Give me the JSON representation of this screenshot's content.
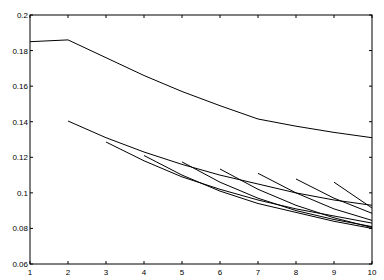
{
  "chart_data": {
    "type": "line",
    "title": "",
    "xlabel": "",
    "ylabel": "",
    "xlim": [
      1,
      10
    ],
    "ylim": [
      0.06,
      0.2
    ],
    "grid": false,
    "legend": "none",
    "x_ticks": [
      1,
      2,
      3,
      4,
      5,
      6,
      7,
      8,
      9,
      10
    ],
    "x_tick_labels": [
      "1",
      "2",
      "3",
      "4",
      "5",
      "6",
      "7",
      "8",
      "9",
      "10"
    ],
    "y_ticks": [
      0.06,
      0.08,
      0.1,
      0.12,
      0.14,
      0.16,
      0.18,
      0.2
    ],
    "y_tick_labels": [
      "0.06",
      "0.08",
      "0.1",
      "0.12",
      "0.14",
      "0.16",
      "0.18",
      "0.2"
    ],
    "series": [
      {
        "name": "series-1",
        "x": [
          1,
          2,
          3,
          4,
          5,
          6,
          7,
          8,
          9,
          10
        ],
        "values": [
          0.185,
          0.186,
          0.176,
          0.166,
          0.157,
          0.149,
          0.1415,
          0.1375,
          0.134,
          0.131
        ]
      },
      {
        "name": "series-2",
        "x": [
          2,
          3,
          4,
          5,
          6,
          7,
          8,
          9,
          10
        ],
        "values": [
          0.1404,
          0.131,
          0.123,
          0.116,
          0.11,
          0.105,
          0.1,
          0.096,
          0.093
        ]
      },
      {
        "name": "series-3",
        "x": [
          3,
          4,
          5,
          6,
          7,
          8,
          9,
          10
        ],
        "values": [
          0.1286,
          0.118,
          0.109,
          0.102,
          0.096,
          0.091,
          0.087,
          0.083
        ]
      },
      {
        "name": "series-4",
        "x": [
          4,
          5,
          6,
          7,
          8,
          9,
          10
        ],
        "values": [
          0.121,
          0.11,
          0.101,
          0.094,
          0.089,
          0.084,
          0.08
        ]
      },
      {
        "name": "series-5",
        "x": [
          5,
          6,
          7,
          8,
          9,
          10
        ],
        "values": [
          0.1174,
          0.106,
          0.097,
          0.09,
          0.085,
          0.081
        ]
      },
      {
        "name": "series-6",
        "x": [
          6,
          7,
          8,
          9,
          10
        ],
        "values": [
          0.1134,
          0.102,
          0.093,
          0.086,
          0.0805
        ]
      },
      {
        "name": "series-7",
        "x": [
          7,
          8,
          9,
          10
        ],
        "values": [
          0.111,
          0.1,
          0.091,
          0.0845
        ]
      },
      {
        "name": "series-8",
        "x": [
          8,
          9,
          10
        ],
        "values": [
          0.1078,
          0.097,
          0.0885
        ]
      },
      {
        "name": "series-9",
        "x": [
          9,
          10
        ],
        "values": [
          0.106,
          0.0915
        ]
      }
    ]
  }
}
